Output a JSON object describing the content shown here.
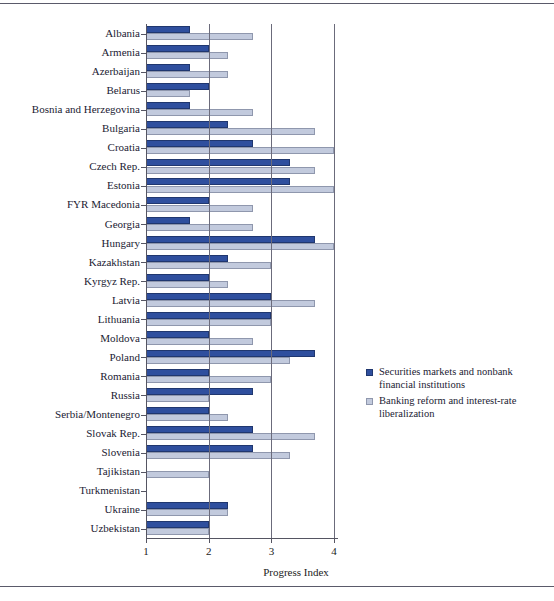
{
  "chart_data": {
    "type": "bar",
    "orientation": "horizontal",
    "title": "",
    "xlabel": "Progress Index",
    "ylabel": "",
    "xlim": [
      1,
      4.1
    ],
    "xticks": [
      1,
      2,
      3,
      4
    ],
    "xticklabels": [
      "1",
      "2",
      "3",
      "4"
    ],
    "grid": true,
    "gridlines_at": [
      2,
      3,
      4
    ],
    "legend_position": "right",
    "categories": [
      "Albania",
      "Armenia",
      "Azerbaijan",
      "Belarus",
      "Bosnia and Herzegovina",
      "Bulgaria",
      "Croatia",
      "Czech Rep.",
      "Estonia",
      "FYR Macedonia",
      "Georgia",
      "Hungary",
      "Kazakhstan",
      "Kyrgyz Rep.",
      "Latvia",
      "Lithuania",
      "Moldova",
      "Poland",
      "Romania",
      "Russia",
      "Serbia/Montenegro",
      "Slovak Rep.",
      "Slovenia",
      "Tajikistan",
      "Turkmenistan",
      "Ukraine",
      "Uzbekistan"
    ],
    "series": [
      {
        "name": "Securities markets and nonbank financial institutions",
        "color": "#2f4f9e",
        "values": [
          1.7,
          2.0,
          1.7,
          2.0,
          1.7,
          2.3,
          2.7,
          3.3,
          3.3,
          2.0,
          1.7,
          3.7,
          2.3,
          2.0,
          3.0,
          3.0,
          2.0,
          3.7,
          2.0,
          2.7,
          2.0,
          2.7,
          2.7,
          1.0,
          1.0,
          2.3,
          2.0
        ]
      },
      {
        "name": "Banking reform and interest-rate liberalization",
        "color": "#c2cadd",
        "values": [
          2.7,
          2.3,
          2.3,
          1.7,
          2.7,
          3.7,
          4.0,
          3.7,
          4.0,
          2.7,
          2.7,
          4.0,
          3.0,
          2.3,
          3.7,
          3.0,
          2.7,
          3.3,
          3.0,
          2.0,
          2.3,
          3.7,
          3.3,
          2.0,
          1.0,
          2.3,
          2.0
        ]
      }
    ]
  },
  "axis": {
    "x_title": "Progress Index",
    "tick_labels": [
      "1",
      "2",
      "3",
      "4"
    ]
  },
  "legend": {
    "entries": [
      {
        "label": "Securities markets and nonbank financial institutions",
        "swatch": "dark"
      },
      {
        "label": "Banking reform and interest-rate liberalization",
        "swatch": "light"
      }
    ]
  }
}
